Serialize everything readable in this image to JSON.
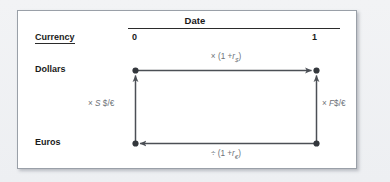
{
  "figure": {
    "kind": "covered-interest-parity-box",
    "header": {
      "date_label": "Date",
      "currency_label": "Currency",
      "date_cols": [
        "0",
        "1"
      ]
    },
    "rows": [
      {
        "label": "Dollars"
      },
      {
        "label": "Euros"
      }
    ],
    "edges": {
      "top": {
        "operator": "×",
        "expr_open": "(1 +",
        "symbol": "r",
        "subscript": "$",
        "expr_close": ")",
        "full_text": "× (1 + r$)"
      },
      "bottom": {
        "operator": "÷",
        "expr_open": "(1 +",
        "symbol": "r",
        "subscript": "€",
        "expr_close": ")",
        "full_text": "÷ (1 + r€)"
      },
      "left": {
        "operator": "×",
        "symbol": "S",
        "units": "$/€",
        "full_text": "× S $/€"
      },
      "right": {
        "operator": "×",
        "symbol": "F",
        "units": "$/€",
        "full_text": "× F $/€"
      }
    },
    "colors": {
      "panel_background": "#ffffff",
      "panel_border": "#9aa0a8",
      "page_background": "#eef0f3",
      "text": "#1a1a1a",
      "edge_label_text": "#6d7278",
      "wire": "#4b4f55",
      "node": "#33373c"
    }
  }
}
